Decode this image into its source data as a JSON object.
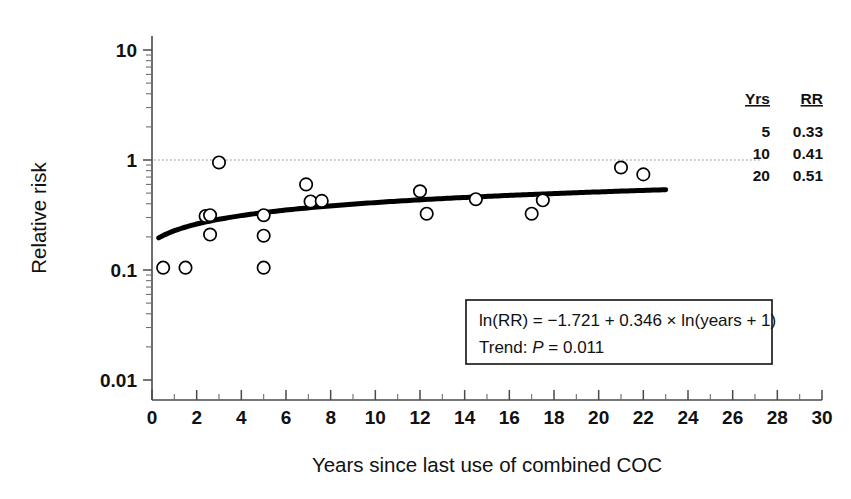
{
  "chart_data": {
    "type": "scatter",
    "title": "",
    "xlabel": "Years since last use of combined COC",
    "ylabel": "Relative risk",
    "xlim": [
      0,
      30
    ],
    "ylim": [
      0.01,
      10
    ],
    "yscale": "log",
    "grid": false,
    "legend_position": "top-right",
    "x_ticks": [
      "0",
      "2",
      "4",
      "6",
      "8",
      "10",
      "12",
      "14",
      "16",
      "18",
      "20",
      "22",
      "24",
      "26",
      "28",
      "30"
    ],
    "x_tick_values": [
      0,
      2,
      4,
      6,
      8,
      10,
      12,
      14,
      16,
      18,
      20,
      22,
      24,
      26,
      28,
      30
    ],
    "y_ticks": [
      "0.01",
      "0.1",
      "1",
      "10"
    ],
    "y_tick_values": [
      0.01,
      0.1,
      1,
      10
    ],
    "reference_line": {
      "y": 1,
      "style": "dotted",
      "label": "null value (RR = 1)"
    },
    "points": [
      {
        "x": 0.5,
        "y": 0.105
      },
      {
        "x": 1.5,
        "y": 0.105
      },
      {
        "x": 2.4,
        "y": 0.31
      },
      {
        "x": 2.6,
        "y": 0.315
      },
      {
        "x": 2.6,
        "y": 0.21
      },
      {
        "x": 3.0,
        "y": 0.95
      },
      {
        "x": 5.0,
        "y": 0.315
      },
      {
        "x": 5.0,
        "y": 0.205
      },
      {
        "x": 5.0,
        "y": 0.105
      },
      {
        "x": 6.9,
        "y": 0.6
      },
      {
        "x": 7.1,
        "y": 0.42
      },
      {
        "x": 7.6,
        "y": 0.425
      },
      {
        "x": 12.0,
        "y": 0.52
      },
      {
        "x": 12.3,
        "y": 0.325
      },
      {
        "x": 14.5,
        "y": 0.44
      },
      {
        "x": 17.0,
        "y": 0.325
      },
      {
        "x": 17.5,
        "y": 0.43
      },
      {
        "x": 21.0,
        "y": 0.855
      },
      {
        "x": 22.0,
        "y": 0.74
      }
    ],
    "fit_curve": {
      "model": "ln(RR) = -1.721 + 0.346 * ln(years + 1)",
      "intercept": -1.721,
      "slope": 0.346,
      "x_start": 0.3,
      "x_end": 23.0
    },
    "annotations": {
      "equation_line1": "ln(RR) = −1.721 + 0.346 × ln(years + 1)",
      "equation_line2_prefix": "Trend: ",
      "equation_line2_italic": "P",
      "equation_line2_suffix": " = 0.011"
    }
  },
  "legend": {
    "header_years": "Yrs",
    "header_rr": "RR",
    "rows": [
      {
        "years": "5",
        "rr": "0.33"
      },
      {
        "years": "10",
        "rr": "0.41"
      },
      {
        "years": "20",
        "rr": "0.51"
      }
    ]
  },
  "axis": {
    "x_title": "Years since last use of combined COC",
    "y_title": "Relative risk",
    "x_labels": [
      "0",
      "2",
      "4",
      "6",
      "8",
      "10",
      "12",
      "14",
      "16",
      "18",
      "20",
      "22",
      "24",
      "26",
      "28",
      "30"
    ],
    "y_labels": [
      "10",
      "1",
      "0.1",
      "0.01"
    ]
  },
  "colors": {
    "axis": "#4a4a4a",
    "curve": "#000000",
    "marker_stroke": "#000000",
    "marker_fill": "#ffffff",
    "reference": "#8a8a8a",
    "text": "#111111",
    "background": "#ffffff"
  }
}
